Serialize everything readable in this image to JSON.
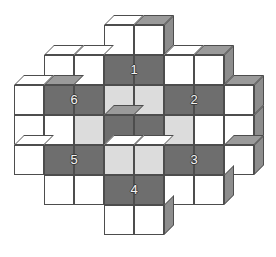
{
  "figure": {
    "background_color": "#ffffff",
    "cell_width": 30,
    "cell_height": 30,
    "depth": 10
  },
  "palette": {
    "white_face": "#ffffff",
    "light_gray_face": "#dcdcdc",
    "dark_gray_face": "#6e6e6e",
    "top_face": "#ffffff",
    "side_face": "#bdbdbd",
    "shadow_top_face": "#9a9a9a",
    "shadow_side_face": "#8d8d8d",
    "outline": "#4d4d4d",
    "number_text": "#f2f2f2",
    "number_outline": "#3a3a3a"
  },
  "labels": [
    {
      "text": "1",
      "x": 104,
      "y": 55,
      "position": "top-center"
    },
    {
      "text": "2",
      "x": 164,
      "y": 85,
      "position": "right-upper"
    },
    {
      "text": "3",
      "x": 164,
      "y": 145,
      "position": "right-lower"
    },
    {
      "text": "4",
      "x": 104,
      "y": 175,
      "position": "bottom-center"
    },
    {
      "text": "5",
      "x": 44,
      "y": 145,
      "position": "left-lower"
    },
    {
      "text": "6",
      "x": 44,
      "y": 85,
      "position": "left-upper"
    }
  ],
  "cubes": [
    {
      "x": 104,
      "y": 25,
      "face": "white",
      "top": true,
      "side": false,
      "shade": false
    },
    {
      "x": 134,
      "y": 25,
      "face": "white",
      "top": true,
      "side": true,
      "shade": true
    },
    {
      "x": 44,
      "y": 55,
      "face": "white",
      "top": true,
      "side": false,
      "shade": false
    },
    {
      "x": 74,
      "y": 55,
      "face": "white",
      "top": true,
      "side": false,
      "shade": false
    },
    {
      "x": 104,
      "y": 55,
      "face": "dark",
      "top": false,
      "side": false,
      "shade": false
    },
    {
      "x": 134,
      "y": 55,
      "face": "dark",
      "top": false,
      "side": false,
      "shade": false
    },
    {
      "x": 164,
      "y": 55,
      "face": "white",
      "top": true,
      "side": false,
      "shade": false
    },
    {
      "x": 194,
      "y": 55,
      "face": "white",
      "top": true,
      "side": true,
      "shade": true
    },
    {
      "x": 14,
      "y": 85,
      "face": "white",
      "top": true,
      "side": false,
      "shade": false
    },
    {
      "x": 44,
      "y": 85,
      "face": "dark",
      "top": true,
      "side": false,
      "shade": true
    },
    {
      "x": 74,
      "y": 85,
      "face": "dark",
      "top": false,
      "side": false,
      "shade": false
    },
    {
      "x": 104,
      "y": 85,
      "face": "light",
      "top": false,
      "side": false,
      "shade": false
    },
    {
      "x": 134,
      "y": 85,
      "face": "light",
      "top": false,
      "side": false,
      "shade": false
    },
    {
      "x": 164,
      "y": 85,
      "face": "dark",
      "top": false,
      "side": false,
      "shade": false
    },
    {
      "x": 194,
      "y": 85,
      "face": "dark",
      "top": false,
      "side": false,
      "shade": false
    },
    {
      "x": 224,
      "y": 85,
      "face": "white",
      "top": true,
      "side": true,
      "shade": true
    },
    {
      "x": 14,
      "y": 115,
      "face": "white",
      "top": false,
      "side": false,
      "shade": false
    },
    {
      "x": 44,
      "y": 115,
      "face": "white",
      "top": false,
      "side": false,
      "shade": false
    },
    {
      "x": 74,
      "y": 115,
      "face": "light",
      "top": false,
      "side": false,
      "shade": false
    },
    {
      "x": 104,
      "y": 115,
      "face": "dark",
      "top": true,
      "side": false,
      "shade": true
    },
    {
      "x": 134,
      "y": 115,
      "face": "dark",
      "top": false,
      "side": false,
      "shade": false
    },
    {
      "x": 164,
      "y": 115,
      "face": "light",
      "top": false,
      "side": false,
      "shade": false
    },
    {
      "x": 194,
      "y": 115,
      "face": "white",
      "top": false,
      "side": false,
      "shade": false
    },
    {
      "x": 224,
      "y": 115,
      "face": "white",
      "top": false,
      "side": true,
      "shade": true
    },
    {
      "x": 14,
      "y": 145,
      "face": "white",
      "top": true,
      "side": false,
      "shade": false
    },
    {
      "x": 44,
      "y": 145,
      "face": "dark",
      "top": false,
      "side": false,
      "shade": false
    },
    {
      "x": 74,
      "y": 145,
      "face": "dark",
      "top": false,
      "side": false,
      "shade": false
    },
    {
      "x": 104,
      "y": 145,
      "face": "light",
      "top": true,
      "side": false,
      "shade": false
    },
    {
      "x": 134,
      "y": 145,
      "face": "light",
      "top": true,
      "side": false,
      "shade": false
    },
    {
      "x": 164,
      "y": 145,
      "face": "dark",
      "top": false,
      "side": false,
      "shade": false
    },
    {
      "x": 194,
      "y": 145,
      "face": "dark",
      "top": false,
      "side": false,
      "shade": false
    },
    {
      "x": 224,
      "y": 145,
      "face": "white",
      "top": true,
      "side": true,
      "shade": true
    },
    {
      "x": 44,
      "y": 175,
      "face": "white",
      "top": false,
      "side": false,
      "shade": false
    },
    {
      "x": 74,
      "y": 175,
      "face": "white",
      "top": false,
      "side": false,
      "shade": false
    },
    {
      "x": 104,
      "y": 175,
      "face": "dark",
      "top": false,
      "side": false,
      "shade": false
    },
    {
      "x": 134,
      "y": 175,
      "face": "dark",
      "top": false,
      "side": false,
      "shade": false
    },
    {
      "x": 164,
      "y": 175,
      "face": "white",
      "top": false,
      "side": false,
      "shade": false
    },
    {
      "x": 194,
      "y": 175,
      "face": "white",
      "top": false,
      "side": true,
      "shade": true
    },
    {
      "x": 104,
      "y": 205,
      "face": "white",
      "top": false,
      "side": false,
      "shade": false
    },
    {
      "x": 134,
      "y": 205,
      "face": "white",
      "top": false,
      "side": true,
      "shade": true
    }
  ]
}
